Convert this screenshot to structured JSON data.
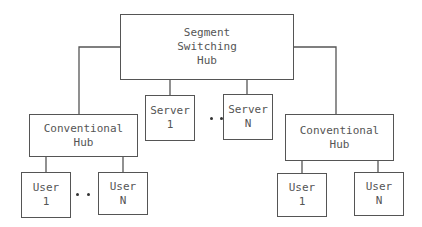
{
  "diagram": {
    "type": "network-topology",
    "nodes": {
      "segment_hub": {
        "lines": [
          "Segment",
          "Switching",
          "Hub"
        ]
      },
      "left_hub": {
        "lines": [
          "Conventional",
          "Hub"
        ]
      },
      "right_hub": {
        "lines": [
          "Conventional",
          "Hub"
        ]
      },
      "server_1": {
        "lines": [
          "Server",
          "1"
        ]
      },
      "server_n": {
        "lines": [
          "Server",
          "N"
        ]
      },
      "left_user_1": {
        "lines": [
          "User",
          "1"
        ]
      },
      "left_user_n": {
        "lines": [
          "User",
          "N"
        ]
      },
      "right_user_1": {
        "lines": [
          "User",
          "1"
        ]
      },
      "right_user_n": {
        "lines": [
          "User",
          "N"
        ]
      }
    },
    "edges": [
      [
        "segment_hub",
        "left_hub"
      ],
      [
        "segment_hub",
        "right_hub"
      ],
      [
        "segment_hub",
        "server_1"
      ],
      [
        "segment_hub",
        "server_n"
      ],
      [
        "left_hub",
        "left_user_1"
      ],
      [
        "left_hub",
        "left_user_n"
      ],
      [
        "right_hub",
        "right_user_1"
      ],
      [
        "right_hub",
        "right_user_n"
      ]
    ],
    "ellipsis_groups": [
      "servers",
      "left_users"
    ],
    "line_color": "#555555"
  }
}
